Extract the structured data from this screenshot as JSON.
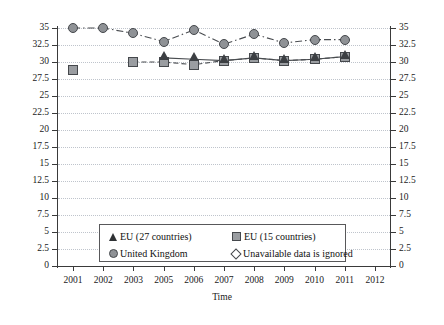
{
  "chart_data": {
    "type": "line",
    "title": "",
    "xlabel": "Time",
    "ylabel": "",
    "categories": [
      "2001",
      "2002",
      "2003",
      "2005",
      "2006",
      "2007",
      "2008",
      "2009",
      "2010",
      "2011",
      "2012"
    ],
    "ylim": [
      0,
      35
    ],
    "ytick_step": 2.5,
    "yticks": [
      "35",
      "32.5",
      "30",
      "27.5",
      "25",
      "22.5",
      "20",
      "17.5",
      "15",
      "12.5",
      "10",
      "7.5",
      "5",
      "2.5",
      "0"
    ],
    "grid": true,
    "dual_y_axis": true,
    "legend_position": "inside-bottom-center",
    "series": [
      {
        "name": "EU (27 countries)",
        "marker": "triangle",
        "linestyle": "solid",
        "values": [
          null,
          null,
          null,
          30.6,
          30.4,
          30.2,
          30.6,
          30.2,
          30.4,
          30.8,
          null
        ]
      },
      {
        "name": "EU (15 countries)",
        "marker": "square",
        "linestyle": "dashed",
        "values": [
          28.8,
          null,
          30.0,
          30.0,
          29.6,
          30.2,
          30.6,
          30.2,
          30.4,
          30.8,
          null
        ]
      },
      {
        "name": "United Kingdom",
        "marker": "circle",
        "linestyle": "dash-dot",
        "values": [
          35.0,
          35.0,
          34.2,
          33.0,
          34.7,
          32.6,
          34.1,
          32.8,
          33.3,
          33.3,
          null
        ]
      },
      {
        "name": "Unavailable data is ignored",
        "marker": "diamond-open",
        "linestyle": "none",
        "values": [
          null,
          null,
          null,
          null,
          null,
          null,
          null,
          null,
          null,
          null,
          null
        ]
      }
    ],
    "colors": {
      "marker_fill": "#8f9296",
      "marker_edge": "#45484c",
      "triangle_fill": "#3c3f43",
      "line": "#4a4d51",
      "grid": "#bfc4cc",
      "axis": "#3a3a3a"
    }
  },
  "legend": {
    "entries": [
      {
        "label": "EU (27 countries)",
        "symbol": "triangle-icon"
      },
      {
        "label": "EU (15 countries)",
        "symbol": "square-icon"
      },
      {
        "label": "United Kingdom",
        "symbol": "circle-icon"
      },
      {
        "label": "Unavailable data is ignored",
        "symbol": "diamond-open-icon"
      }
    ]
  }
}
